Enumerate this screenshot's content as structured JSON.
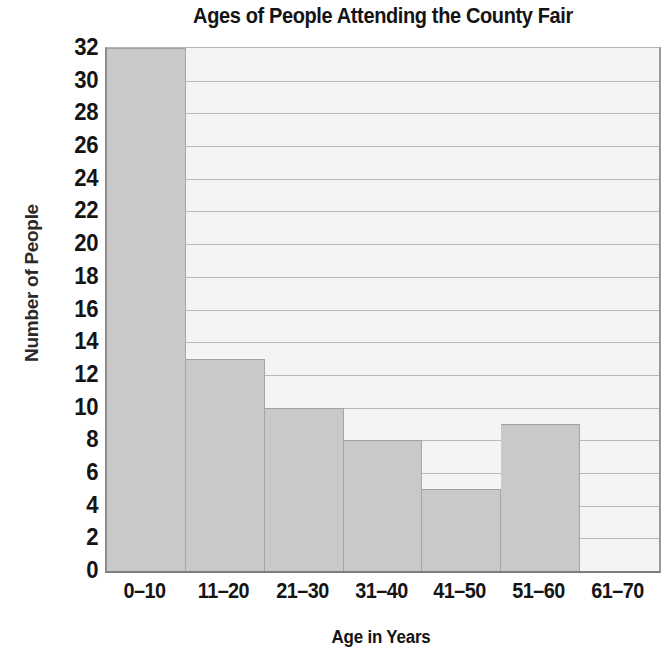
{
  "chart_data": {
    "type": "bar",
    "title": "Ages of People Attending the County Fair",
    "xlabel": "Age in Years",
    "ylabel": "Number of People",
    "categories": [
      "0–10",
      "11–20",
      "21–30",
      "31–40",
      "41–50",
      "51–60",
      "61–70"
    ],
    "values": [
      32,
      13,
      10,
      8,
      5,
      9,
      0
    ],
    "ylim": [
      0,
      32
    ],
    "ytick_step": 2,
    "yticks": [
      32,
      30,
      28,
      26,
      24,
      22,
      20,
      18,
      16,
      14,
      12,
      10,
      8,
      6,
      4,
      2,
      0
    ],
    "ytick_labels": [
      "32",
      "30",
      "28",
      "26",
      "24",
      "22",
      "20",
      "18",
      "16",
      "14",
      "12",
      "10",
      "8",
      "6",
      "4",
      "2",
      "0"
    ],
    "grid": true,
    "grid_axis": "y",
    "legend": null,
    "bar_color": "#c9c9c9",
    "bar_edge_color": "#a2a2a2",
    "plot_background": "#f4f4f4",
    "gridline_color": "#b9b9b9",
    "axis_color": "#7d7d7d",
    "text_color": "#141414"
  }
}
